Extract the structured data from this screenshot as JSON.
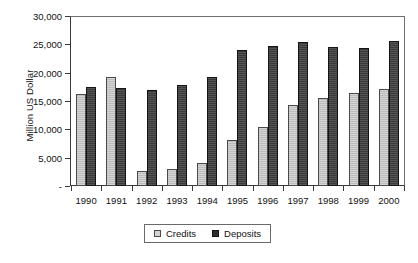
{
  "chart_data": {
    "type": "bar",
    "title": "",
    "xlabel": "",
    "ylabel": "Million US Dollar",
    "categories": [
      "1990",
      "1991",
      "1992",
      "1993",
      "1994",
      "1995",
      "1996",
      "1997",
      "1998",
      "1999",
      "2000"
    ],
    "series": [
      {
        "name": "Credits",
        "color": "#bdbdbd",
        "values": [
          16300,
          19300,
          2700,
          3000,
          4000,
          8100,
          10500,
          14400,
          15700,
          16500,
          17200
        ]
      },
      {
        "name": "Deposits",
        "color": "#3b3b3b",
        "values": [
          17500,
          17400,
          17000,
          17900,
          19300,
          24200,
          24800,
          25500,
          24600,
          24500,
          25800
        ]
      }
    ],
    "ylim": [
      0,
      30000
    ],
    "ytick_values": [
      0,
      5000,
      10000,
      15000,
      20000,
      25000,
      30000
    ],
    "ytick_labels": [
      "-",
      "5,000",
      "10,000",
      "15,000",
      "20,000",
      "25,000",
      "30,000"
    ],
    "grid": false,
    "legend_position": "bottom"
  },
  "axes": {
    "y_title": "Million US Dollar"
  },
  "legend": {
    "items": [
      {
        "label": "Credits",
        "swatch": "credits-swatch"
      },
      {
        "label": "Deposits",
        "swatch": "deposits-swatch"
      }
    ]
  }
}
